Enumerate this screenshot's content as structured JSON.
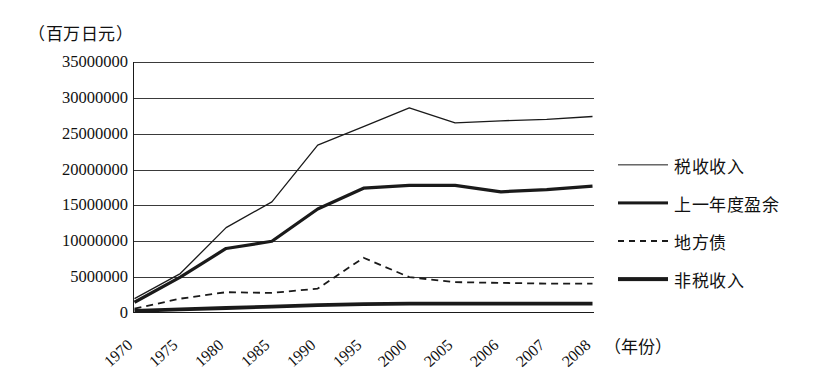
{
  "chart_data": {
    "type": "line",
    "title": "",
    "subtitle": "",
    "ylabel": "（百万日元）",
    "xlabel": "（年份）",
    "categories": [
      "1970",
      "1975",
      "1980",
      "1985",
      "1990",
      "1995",
      "2000",
      "2005",
      "2006",
      "2007",
      "2008"
    ],
    "ylim": [
      0,
      35000000
    ],
    "ytick_step": 5000000,
    "yticks": [
      "35000000",
      "30000000",
      "25000000",
      "20000000",
      "15000000",
      "10000000",
      "5000000",
      "0"
    ],
    "ytick_values": [
      35000000,
      30000000,
      25000000,
      20000000,
      15000000,
      10000000,
      5000000,
      0
    ],
    "grid": true,
    "legend_position": "right",
    "series": [
      {
        "name": "税收收入",
        "style": "thin-solid",
        "color": "#1a1a1a",
        "width": 1.3,
        "dash": "",
        "values": [
          2000000,
          5500000,
          11900000,
          15500000,
          23400000,
          26000000,
          28600000,
          26500000,
          26800000,
          27000000,
          27400000
        ]
      },
      {
        "name": "上一年度盈余",
        "style": "medium-solid",
        "color": "#1a1a1a",
        "width": 3.2,
        "dash": "",
        "values": [
          1500000,
          5000000,
          9000000,
          10000000,
          14500000,
          17400000,
          17800000,
          17800000,
          16900000,
          17200000,
          17700000
        ]
      },
      {
        "name": "地方债",
        "style": "dashed",
        "color": "#1a1a1a",
        "width": 1.8,
        "dash": "7,5",
        "values": [
          600000,
          2000000,
          2900000,
          2800000,
          3400000,
          7700000,
          5000000,
          4300000,
          4200000,
          4100000,
          4100000
        ]
      },
      {
        "name": "非税收入",
        "style": "thick-solid",
        "color": "#1a1a1a",
        "width": 3.8,
        "dash": "",
        "values": [
          300000,
          500000,
          700000,
          900000,
          1100000,
          1250000,
          1300000,
          1300000,
          1300000,
          1300000,
          1300000
        ]
      }
    ]
  },
  "legend": {
    "items": [
      {
        "label": "税收收入"
      },
      {
        "label": "上一年度盈余"
      },
      {
        "label": "地方债"
      },
      {
        "label": "非税收入"
      }
    ]
  }
}
